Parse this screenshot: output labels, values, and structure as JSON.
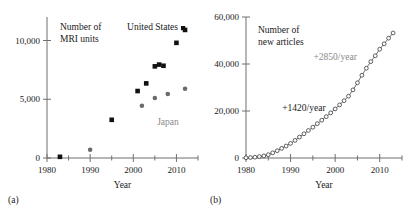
{
  "figure": {
    "panels": [
      {
        "letter": "(a)",
        "xlabel": "Year",
        "title_line1": "Number of",
        "title_line2": "MRI units",
        "legend_us": "United States",
        "legend_japan": "Japan"
      },
      {
        "letter": "(b)",
        "xlabel": "Year",
        "title_line1": "Number of",
        "title_line2": "new articles",
        "annotation_early": "+1420/year",
        "annotation_late": "+2850/year"
      }
    ]
  },
  "chart_data": [
    {
      "type": "scatter",
      "panel": "a",
      "title": "Number of MRI units",
      "xlabel": "Year",
      "ylabel": "Number of MRI units",
      "xlim": [
        1980,
        2015
      ],
      "ylim": [
        0,
        12000
      ],
      "xticks": [
        1980,
        1990,
        2000,
        2010
      ],
      "xticklabels": [
        "1980",
        "1990",
        "2000",
        "2010"
      ],
      "xminorticks": [
        1985,
        1995,
        2005,
        2015
      ],
      "yticks": [
        0,
        5000,
        10000
      ],
      "yticklabels": [
        "0",
        "5,000",
        "10,000"
      ],
      "grid": false,
      "legend_position": "top-right",
      "series": [
        {
          "name": "United States",
          "marker": "square",
          "color": "#111111",
          "points": [
            {
              "x": 1983,
              "y": 100
            },
            {
              "x": 1995,
              "y": 3250
            },
            {
              "x": 2001,
              "y": 5700
            },
            {
              "x": 2003,
              "y": 6350
            },
            {
              "x": 2005,
              "y": 7800
            },
            {
              "x": 2006,
              "y": 7950
            },
            {
              "x": 2007,
              "y": 7850
            },
            {
              "x": 2010,
              "y": 9800
            },
            {
              "x": 2012,
              "y": 10900
            }
          ]
        },
        {
          "name": "Japan",
          "marker": "circle",
          "color": "#6b6b6b",
          "points": [
            {
              "x": 1990,
              "y": 700
            },
            {
              "x": 2002,
              "y": 4450
            },
            {
              "x": 2005,
              "y": 5100
            },
            {
              "x": 2008,
              "y": 5450
            },
            {
              "x": 2012,
              "y": 5900
            }
          ]
        }
      ]
    },
    {
      "type": "line",
      "panel": "b",
      "title": "Number of new articles",
      "xlabel": "Year",
      "ylabel": "Number of new articles",
      "xlim": [
        1980,
        2015
      ],
      "ylim": [
        0,
        60000
      ],
      "xticks": [
        1980,
        1990,
        2000,
        2010
      ],
      "xticklabels": [
        "1980",
        "1990",
        "2000",
        "2010"
      ],
      "xminorticks": [
        1985,
        1995,
        2005,
        2015
      ],
      "yticks": [
        0,
        20000,
        40000,
        60000
      ],
      "yticklabels": [
        "0",
        "20,000",
        "40,000",
        "60,000"
      ],
      "grid": false,
      "marker": "open-circle",
      "annotations": [
        {
          "text": "+1420/year",
          "x": 1993,
          "y": 20000,
          "color": "#1a1a1a"
        },
        {
          "text": "+2850/year",
          "x": 2000,
          "y": 41500,
          "color": "#8a8a8a"
        }
      ],
      "x": [
        1980,
        1981,
        1982,
        1983,
        1984,
        1985,
        1986,
        1987,
        1988,
        1989,
        1990,
        1991,
        1992,
        1993,
        1994,
        1995,
        1996,
        1997,
        1998,
        1999,
        2000,
        2001,
        2002,
        2003,
        2004,
        2005,
        2006,
        2007,
        2008,
        2009,
        2010,
        2011,
        2012,
        2013
      ],
      "values": [
        100,
        200,
        350,
        600,
        900,
        1400,
        2200,
        3100,
        4100,
        5100,
        6200,
        7500,
        8900,
        10300,
        11700,
        13100,
        14600,
        16100,
        17600,
        19200,
        20900,
        22600,
        24400,
        26300,
        29000,
        32000,
        35200,
        38200,
        41000,
        43500,
        46300,
        48600,
        51000,
        53200
      ]
    }
  ]
}
